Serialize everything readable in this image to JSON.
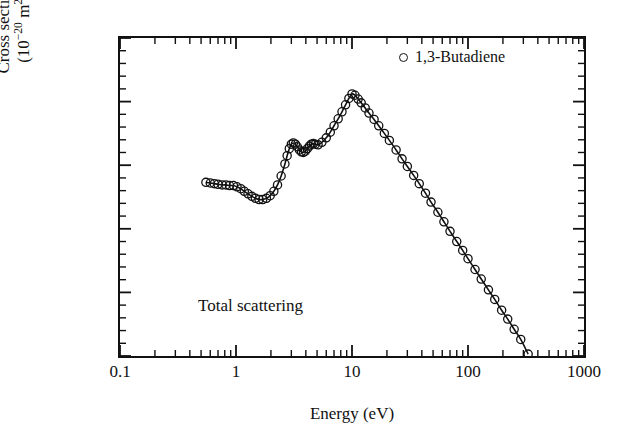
{
  "chart_data": {
    "type": "line",
    "title": "",
    "xlabel": "Energy (eV)",
    "ylabel_line1": "Cross section",
    "ylabel_line2_pre": "(10",
    "ylabel_line2_exp": "−20",
    "ylabel_line2_post": " m",
    "ylabel_line2_exp2": "2",
    "ylabel_line2_end": ")",
    "annotation": "Total scattering",
    "legend_position": "top-right",
    "legend": [
      {
        "label": "1,3-Butadiene",
        "marker": "open-circle"
      }
    ],
    "xscale": "log",
    "yscale": "linear",
    "xlim": [
      0.1,
      1000
    ],
    "ylim": [
      10,
      60
    ],
    "xticks": [
      0.1,
      1,
      10,
      100,
      1000
    ],
    "xtick_labels": [
      "0.1",
      "1",
      "10",
      "100",
      "1000"
    ],
    "yticks": [
      10,
      20,
      30,
      40,
      50,
      60
    ],
    "ytick_labels": [
      "10",
      "20",
      "30",
      "40",
      "50",
      "60"
    ],
    "y_minor_step": 2,
    "grid": false,
    "series": [
      {
        "name": "1,3-Butadiene",
        "marker": "open-circle",
        "x": [
          0.55,
          0.6,
          0.65,
          0.7,
          0.76,
          0.82,
          0.88,
          0.95,
          1.02,
          1.1,
          1.18,
          1.27,
          1.37,
          1.47,
          1.58,
          1.7,
          1.83,
          1.97,
          2.12,
          2.28,
          2.45,
          2.64,
          2.76,
          2.88,
          3.0,
          3.12,
          3.25,
          3.38,
          3.52,
          3.66,
          3.81,
          3.96,
          4.12,
          4.29,
          4.46,
          4.64,
          4.83,
          5.1,
          5.5,
          6.0,
          6.5,
          7.0,
          7.6,
          8.2,
          8.8,
          9.4,
          10.0,
          10.6,
          11.3,
          12.0,
          13.0,
          14.0,
          15.5,
          17.0,
          19.0,
          21.0,
          24.0,
          27.0,
          30.0,
          34.0,
          38.0,
          43.0,
          48.0,
          55.0,
          62.0,
          70.0,
          80.0,
          90.0,
          100.0,
          115.0,
          130.0,
          150.0,
          170.0,
          195.0,
          220.0,
          250.0,
          285.0,
          330.0
        ],
        "y": [
          37.3,
          37.2,
          37.1,
          37.0,
          36.9,
          36.9,
          36.8,
          36.8,
          36.6,
          36.3,
          35.9,
          35.5,
          35.1,
          34.8,
          34.6,
          34.6,
          34.8,
          35.2,
          35.9,
          36.9,
          38.3,
          40.2,
          41.5,
          42.6,
          43.3,
          43.5,
          43.3,
          42.9,
          42.4,
          42.1,
          42.0,
          42.2,
          42.6,
          43.0,
          43.3,
          43.4,
          43.3,
          43.2,
          43.6,
          44.3,
          45.2,
          46.2,
          47.3,
          48.4,
          49.5,
          50.5,
          51.2,
          51.0,
          50.4,
          49.8,
          49.0,
          48.2,
          47.2,
          46.2,
          45.0,
          43.9,
          42.4,
          41.0,
          39.8,
          38.4,
          37.1,
          35.6,
          34.2,
          32.6,
          31.1,
          29.6,
          28.0,
          26.6,
          25.3,
          23.6,
          22.1,
          20.4,
          18.9,
          17.2,
          15.8,
          14.2,
          12.6,
          10.3
        ]
      }
    ]
  }
}
